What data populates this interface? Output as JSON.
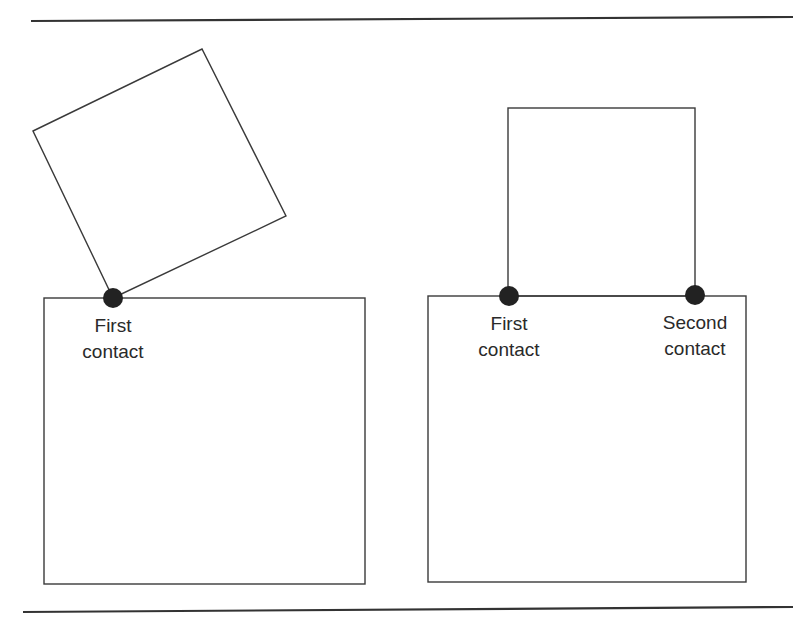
{
  "diagram": {
    "colors": {
      "stroke": "#3a3a3a",
      "rule": "#333333",
      "contact_dot": "#222222",
      "text": "#2a2a2a",
      "background": "#ffffff"
    },
    "rules": {
      "top": {
        "x1": 31,
        "y1": 21,
        "x2": 793,
        "y2": 17
      },
      "bottom": {
        "x1": 23,
        "y1": 612,
        "x2": 793,
        "y2": 607
      }
    },
    "left_panel": {
      "tilted_square": [
        [
          33,
          131
        ],
        [
          202,
          49
        ],
        [
          286,
          216
        ],
        [
          113,
          298
        ]
      ],
      "base_box": {
        "x": 44,
        "y": 298,
        "width": 321,
        "height": 286
      },
      "contacts": [
        {
          "cx": 113,
          "cy": 298,
          "r": 10,
          "label_line1": "First",
          "label_line2": "contact",
          "label_x": 113
        }
      ]
    },
    "right_panel": {
      "upright_square": {
        "x": 508,
        "y": 108,
        "width": 187,
        "height": 188
      },
      "base_box": {
        "x": 428,
        "y": 296,
        "width": 318,
        "height": 286
      },
      "contacts": [
        {
          "cx": 509,
          "cy": 296,
          "r": 10,
          "label_line1": "First",
          "label_line2": "contact",
          "label_x": 509
        },
        {
          "cx": 695,
          "cy": 295,
          "r": 10,
          "label_line1": "Second",
          "label_line2": "contact",
          "label_x": 695
        }
      ]
    }
  }
}
